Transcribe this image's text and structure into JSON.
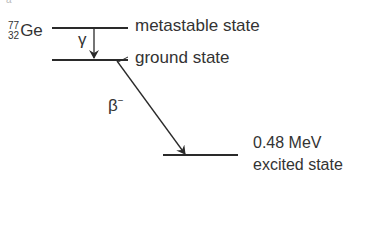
{
  "diagram": {
    "nuclide": {
      "mass_number": "77",
      "atomic_number": "32",
      "symbol": "Ge"
    },
    "levels": [
      {
        "id": "metastable",
        "label": "metastable state"
      },
      {
        "id": "ground",
        "label": "ground state"
      },
      {
        "id": "excited",
        "energy": "0.48 MeV",
        "label": "excited state"
      }
    ],
    "transitions": [
      {
        "from": "metastable",
        "to": "ground",
        "symbol": "γ"
      },
      {
        "from": "ground",
        "to": "excited",
        "symbol": "β",
        "charge": "−"
      }
    ],
    "colors": {
      "line": "#2a2a2a",
      "text": "#333333",
      "background": "#ffffff"
    }
  }
}
